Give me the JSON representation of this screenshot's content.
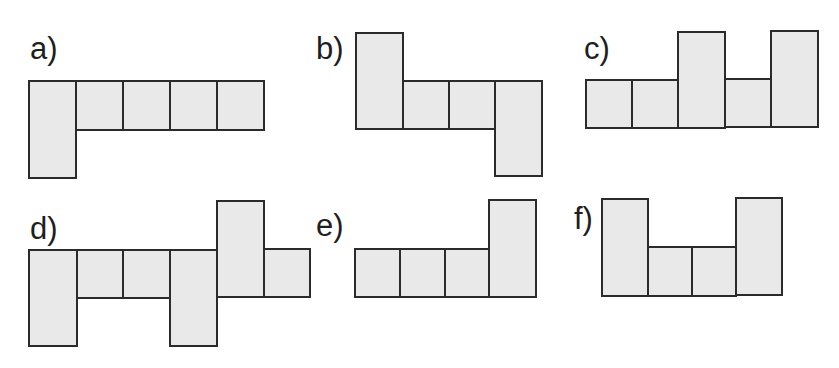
{
  "figures": [
    {
      "label": "a)",
      "label_pos": [
        30,
        33
      ],
      "cells": [
        {
          "x": 28,
          "y": 80,
          "w": 49,
          "h": 99
        },
        {
          "x": 75,
          "y": 80,
          "w": 49,
          "h": 51
        },
        {
          "x": 122,
          "y": 80,
          "w": 49,
          "h": 51
        },
        {
          "x": 169,
          "y": 80,
          "w": 49,
          "h": 51
        },
        {
          "x": 216,
          "y": 80,
          "w": 49,
          "h": 51
        }
      ]
    },
    {
      "label": "b)",
      "label_pos": [
        316,
        33
      ],
      "cells": [
        {
          "x": 355,
          "y": 32,
          "w": 49,
          "h": 98
        },
        {
          "x": 402,
          "y": 80,
          "w": 49,
          "h": 50
        },
        {
          "x": 448,
          "y": 80,
          "w": 49,
          "h": 50
        },
        {
          "x": 494,
          "y": 80,
          "w": 49,
          "h": 97
        }
      ]
    },
    {
      "label": "c)",
      "label_pos": [
        584,
        33
      ],
      "cells": [
        {
          "x": 585,
          "y": 79,
          "w": 48,
          "h": 50
        },
        {
          "x": 631,
          "y": 79,
          "w": 48,
          "h": 50
        },
        {
          "x": 677,
          "y": 31,
          "w": 49,
          "h": 98
        },
        {
          "x": 724,
          "y": 78,
          "w": 48,
          "h": 50
        },
        {
          "x": 770,
          "y": 30,
          "w": 49,
          "h": 98
        }
      ]
    },
    {
      "label": "d)",
      "label_pos": [
        30,
        213
      ],
      "cells": [
        {
          "x": 28,
          "y": 249,
          "w": 50,
          "h": 98
        },
        {
          "x": 76,
          "y": 249,
          "w": 48,
          "h": 50
        },
        {
          "x": 122,
          "y": 249,
          "w": 49,
          "h": 50
        },
        {
          "x": 169,
          "y": 249,
          "w": 49,
          "h": 98
        },
        {
          "x": 216,
          "y": 200,
          "w": 49,
          "h": 98
        },
        {
          "x": 263,
          "y": 248,
          "w": 48,
          "h": 50
        }
      ]
    },
    {
      "label": "e)",
      "label_pos": [
        316,
        210
      ],
      "cells": [
        {
          "x": 354,
          "y": 248,
          "w": 47,
          "h": 50
        },
        {
          "x": 399,
          "y": 248,
          "w": 47,
          "h": 50
        },
        {
          "x": 444,
          "y": 248,
          "w": 46,
          "h": 50
        },
        {
          "x": 488,
          "y": 199,
          "w": 49,
          "h": 99
        }
      ]
    },
    {
      "label": "f)",
      "label_pos": [
        574,
        203
      ],
      "cells": [
        {
          "x": 601,
          "y": 198,
          "w": 48,
          "h": 99
        },
        {
          "x": 647,
          "y": 246,
          "w": 46,
          "h": 51
        },
        {
          "x": 691,
          "y": 246,
          "w": 46,
          "h": 51
        },
        {
          "x": 735,
          "y": 197,
          "w": 48,
          "h": 99
        }
      ]
    }
  ],
  "colors": {
    "fill": "#e9e9e9",
    "stroke": "#2b2b2b",
    "label": "#1f1f1f"
  }
}
